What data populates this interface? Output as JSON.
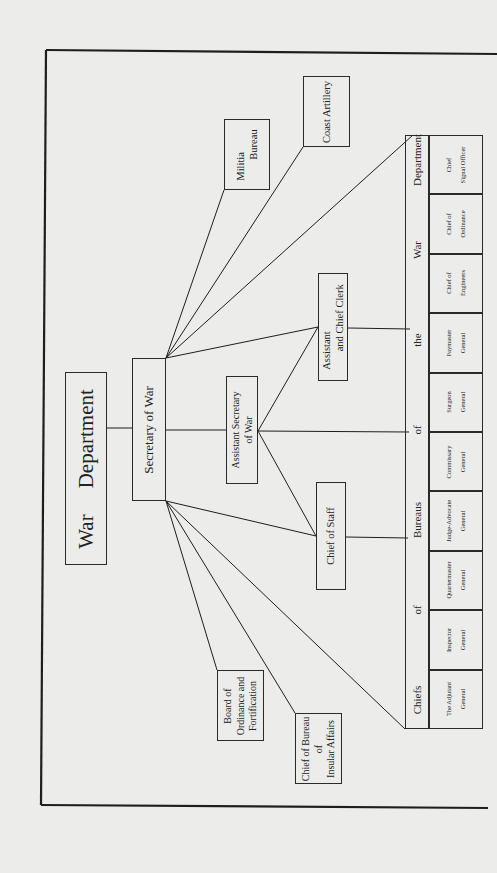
{
  "title": {
    "word1": "War",
    "word2": "Department"
  },
  "secretary": "Secretary of War",
  "assistant_secretary": "Assistant Secretary\nof War",
  "assistant_chief_clerk": "Assistant\n       and Chief Clerk",
  "chief_of_staff": "Chief of Staff",
  "militia_bureau": "Militia\n        Bureau",
  "coast_artillery": "Coast Artillery",
  "board_ordinance": "Board of\nOrdinance and\nFortification",
  "insular_affairs": "Chief of Bureau\nof\nInsular Affairs",
  "bureaus_header": {
    "words": [
      "Chiefs",
      "of",
      "Bureaus",
      "of",
      "the",
      "War",
      "Department"
    ]
  },
  "bureaus": [
    "The Adjutant\nGeneral",
    "Inspector\nGeneral",
    "Quartermaster\nGeneral",
    "Judge-Advocate\nGeneral",
    "Commissary\nGeneral",
    "Surgeon\nGeneral",
    "Paymaster\nGeneral",
    "Chief of\nEngineers",
    "Chief of\nOrdinance",
    "Chief\nSignal Officer"
  ]
}
